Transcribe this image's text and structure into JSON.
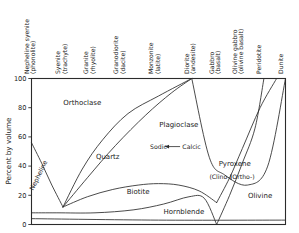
{
  "chart_data": {
    "type": "area",
    "title": "",
    "xlabel": "",
    "ylabel": "Percent by volume",
    "ylim": [
      0,
      100
    ],
    "grid": false,
    "legend": "none",
    "y_ticks": [
      "0",
      "20",
      "40",
      "60",
      "80",
      "100"
    ],
    "y_tick_values": [
      0,
      20,
      40,
      60,
      80,
      100
    ],
    "x_categories": [
      {
        "rock": "Nepheline syenite",
        "volcanic": "(phonolite)",
        "x_frac": 0.0
      },
      {
        "rock": "Syenite",
        "volcanic": "(trachyte)",
        "x_frac": 0.124
      },
      {
        "rock": "Granite",
        "volcanic": "(rhyolite)",
        "x_frac": 0.235
      },
      {
        "rock": "Granodiorite",
        "volcanic": "(dacite)",
        "x_frac": 0.353
      },
      {
        "rock": "Monzonite",
        "volcanic": "(latite)",
        "x_frac": 0.49
      },
      {
        "rock": "Diorite",
        "volcanic": "(andesite)",
        "x_frac": 0.631
      },
      {
        "rock": "Gabbro",
        "volcanic": "(basalt)",
        "x_frac": 0.729
      },
      {
        "rock": "Olivine gabbro",
        "volcanic": "(olivine basalt)",
        "x_frac": 0.82
      },
      {
        "rock": "Peridotite",
        "volcanic": "",
        "x_frac": 0.915
      },
      {
        "rock": "Dunite",
        "volcanic": "",
        "x_frac": 1.0
      }
    ],
    "mineral_fields": [
      {
        "name": "Orthoclase",
        "label_x_frac": 0.2,
        "label_y": 82
      },
      {
        "name": "Quartz",
        "label_x_frac": 0.3,
        "label_y": 45
      },
      {
        "name": "Nepheline",
        "label_x_frac": 0.035,
        "label_y": 33,
        "rotated": true
      },
      {
        "name": "Plagioclase",
        "label_x_frac": 0.58,
        "label_y": 67
      },
      {
        "name": "Biotite",
        "label_x_frac": 0.42,
        "label_y": 21
      },
      {
        "name": "Hornblende",
        "label_x_frac": 0.6,
        "label_y": 7
      },
      {
        "name": "Pyroxene",
        "label_x_frac": 0.8,
        "label_y": 40
      },
      {
        "name": "Olivine",
        "label_x_frac": 0.9,
        "label_y": 18
      }
    ],
    "annotations": [
      {
        "text": "Sodic",
        "x_frac": 0.5,
        "y": 52
      },
      {
        "text": "Calcic",
        "x_frac": 0.63,
        "y": 52
      },
      {
        "text": "(Clino-)",
        "x_frac": 0.745,
        "y": 31
      },
      {
        "text": "(Ortho-)",
        "x_frac": 0.83,
        "y": 31
      },
      {
        "text": "arrow-sodic-calcic",
        "x_frac": 0.565,
        "y": 52
      }
    ],
    "series": [
      {
        "name": "Nepheline boundary",
        "points": [
          [
            0.0,
            56
          ],
          [
            0.04,
            42
          ],
          [
            0.08,
            27
          ],
          [
            0.124,
            12
          ]
        ]
      },
      {
        "name": "Quartz upper boundary",
        "points": [
          [
            0.124,
            12
          ],
          [
            0.2,
            38
          ],
          [
            0.28,
            58
          ],
          [
            0.38,
            76
          ],
          [
            0.5,
            88
          ],
          [
            0.631,
            100
          ]
        ]
      },
      {
        "name": "Quartz lower boundary",
        "points": [
          [
            0.124,
            12
          ],
          [
            0.22,
            32
          ],
          [
            0.33,
            54
          ],
          [
            0.45,
            75
          ],
          [
            0.55,
            90
          ],
          [
            0.631,
            100
          ]
        ]
      },
      {
        "name": "Biotite upper boundary",
        "points": [
          [
            0.124,
            12
          ],
          [
            0.22,
            19
          ],
          [
            0.32,
            24
          ],
          [
            0.42,
            27
          ],
          [
            0.5,
            28
          ],
          [
            0.58,
            27
          ],
          [
            0.66,
            23
          ],
          [
            0.729,
            15
          ]
        ]
      },
      {
        "name": "Hornblende lower boundary",
        "points": [
          [
            0.0,
            8
          ],
          [
            0.1,
            8
          ],
          [
            0.25,
            8
          ],
          [
            0.4,
            10
          ],
          [
            0.52,
            14
          ],
          [
            0.62,
            19
          ],
          [
            0.68,
            18
          ],
          [
            0.729,
            0
          ]
        ]
      },
      {
        "name": "Pyroxene lower left boundary",
        "points": [
          [
            0.729,
            0
          ],
          [
            0.78,
            20
          ],
          [
            0.83,
            42
          ],
          [
            0.88,
            66
          ],
          [
            0.915,
            100
          ]
        ]
      },
      {
        "name": "Pyroxene-olivine boundary",
        "points": [
          [
            0.729,
            15
          ],
          [
            0.78,
            32
          ],
          [
            0.83,
            52
          ],
          [
            0.9,
            80
          ],
          [
            0.965,
            100
          ]
        ]
      },
      {
        "name": "Plagioclase-pyroxene boundary",
        "points": [
          [
            0.631,
            100
          ],
          [
            0.7,
            46
          ],
          [
            0.76,
            34
          ],
          [
            0.85,
            27
          ],
          [
            0.93,
            40
          ],
          [
            1.0,
            100
          ]
        ]
      },
      {
        "name": "Base line",
        "points": [
          [
            0.0,
            4
          ],
          [
            0.5,
            3
          ],
          [
            1.0,
            3
          ]
        ]
      }
    ]
  },
  "figure": {
    "y_axis_title": "Percent by volume"
  }
}
